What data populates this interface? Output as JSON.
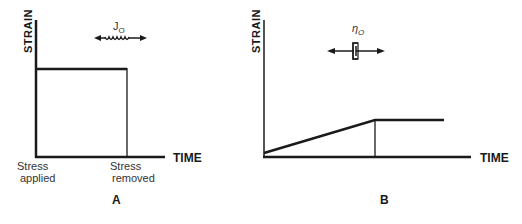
{
  "panels": [
    {
      "id": "A",
      "label": "A",
      "y_axis_label": "STRAIN",
      "x_axis_label": "TIME",
      "element_symbol": "J",
      "element_subscript": "O",
      "element_type": "spring",
      "annotations": {
        "start_line1": "Stress",
        "start_line2": "applied",
        "end_line1": "Stress",
        "end_line2": "removed"
      },
      "curve": "instantaneous step strain while stress applied, drops to zero when removed"
    },
    {
      "id": "B",
      "label": "B",
      "y_axis_label": "STRAIN",
      "x_axis_label": "TIME",
      "element_symbol": "η",
      "element_subscript": "O",
      "element_type": "dashpot",
      "curve": "linear increase in strain, then constant after stress removed"
    }
  ]
}
